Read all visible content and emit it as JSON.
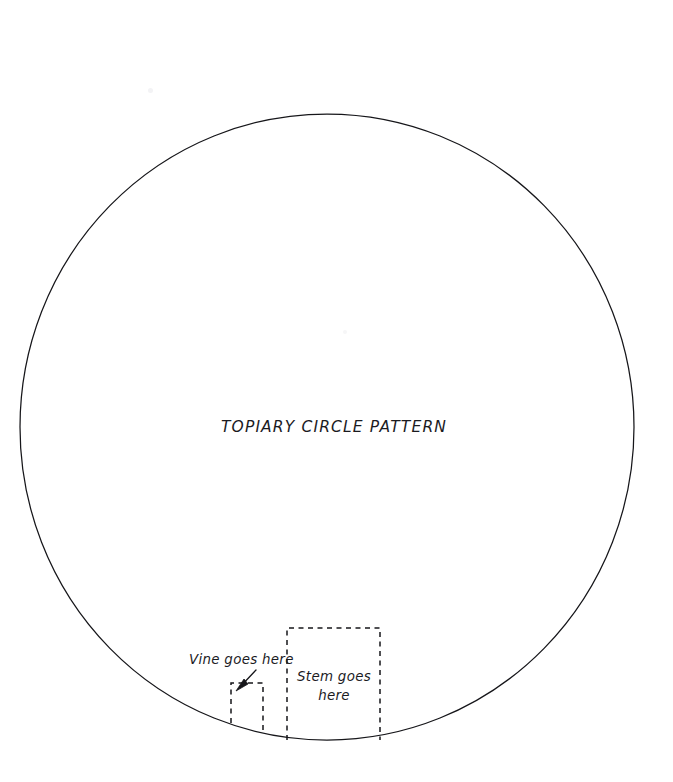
{
  "document": {
    "title": "TOPIARY CIRCLE PATTERN",
    "background_color": "#ffffff",
    "ink_color": "#16161a",
    "width": 673,
    "height": 782
  },
  "shapes": {
    "circle": {
      "name": "topiary-circle-outline",
      "center_x": 327,
      "center_y": 427,
      "radius_x": 307,
      "radius_y": 313,
      "stroke_color": "#16161a",
      "stroke_width": 1.25,
      "style": "solid"
    },
    "stem_cutout": {
      "name": "stem-placement-box",
      "label_line_1": "Stem goes",
      "label_line_2": "here",
      "x": 287,
      "y": 628,
      "width": 93,
      "height": 112,
      "style": "dashed",
      "bottom_open": true
    },
    "vine_cutout": {
      "name": "vine-placement-box",
      "label": "Vine goes here",
      "x": 231,
      "y": 683,
      "width": 32,
      "height": 44,
      "style": "dashed",
      "bottom_open": true
    }
  },
  "annotations": {
    "vine_label": {
      "text": "Vine goes here",
      "x": 189,
      "y": 664
    },
    "stem_label": {
      "line_1": "Stem goes",
      "line_2": "here",
      "center_x": 334,
      "line_1_y": 681,
      "line_2_y": 700
    },
    "leader_arrow": {
      "name": "vine-leader-arrow",
      "from_x": 255,
      "from_y": 671,
      "to_x": 238,
      "to_y": 689
    }
  }
}
